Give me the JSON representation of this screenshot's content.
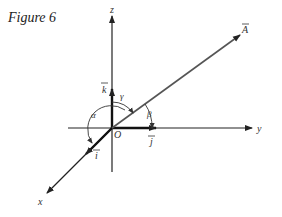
{
  "figure": {
    "title": "Figure 6"
  },
  "labels": {
    "z_axis": "z",
    "y_axis": "y",
    "x_axis": "x",
    "origin": "O",
    "vector": "A",
    "unit_i": "i",
    "unit_j": "j",
    "unit_k": "k",
    "alpha": "α",
    "beta": "β",
    "gamma": "γ"
  },
  "colors": {
    "axis": "#222222",
    "vector": "#555555"
  }
}
